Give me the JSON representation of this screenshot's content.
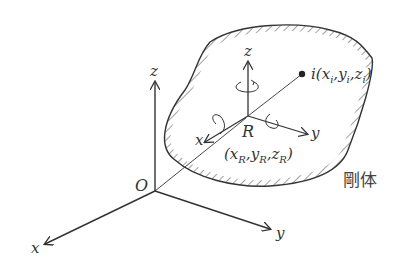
{
  "diagram": {
    "type": "rigid-body coordinate frames",
    "world_frame": {
      "origin_label": "O",
      "x_label": "x",
      "y_label": "y",
      "z_label": "z"
    },
    "body_frame": {
      "origin_label": "R",
      "coords_label": "(xR,yR,zR)",
      "coords_parts": {
        "open": "(",
        "x": "x",
        "xs": "R",
        "y": "y",
        "ys": "R",
        "z": "z",
        "zs": "R",
        "close": ")"
      },
      "x_label": "x",
      "y_label": "y",
      "z_label": "z"
    },
    "point": {
      "label": "i(xi,yi,zi)",
      "parts": {
        "name": "i",
        "open": "(",
        "x": "x",
        "xs": "i",
        "y": "y",
        "ys": "i",
        "z": "z",
        "zs": "i",
        "close": ")"
      }
    },
    "body_label": "剛体",
    "colors": {
      "line": "#333333",
      "background": "#ffffff"
    }
  }
}
